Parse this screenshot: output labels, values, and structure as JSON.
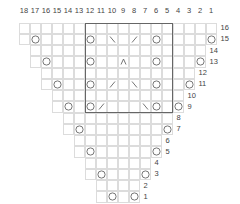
{
  "chart": {
    "title": "",
    "type": "knitting-chart",
    "columns": [
      "18",
      "17",
      "16",
      "15",
      "14",
      "13",
      "12",
      "11",
      "10",
      "9",
      "8",
      "7",
      "6",
      "5",
      "4",
      "3",
      "2",
      "1"
    ],
    "rows": [
      {
        "row": 16,
        "label": "16",
        "from_col": 18,
        "to_col": 1,
        "symbols": []
      },
      {
        "row": 15,
        "label": "15",
        "from_col": 18,
        "to_col": 1,
        "symbols": [
          {
            "col": 17,
            "type": "yo"
          },
          {
            "col": 12,
            "type": "yo"
          },
          {
            "col": 10,
            "type": "ssk"
          },
          {
            "col": 8,
            "type": "k2tog"
          },
          {
            "col": 6,
            "type": "yo"
          },
          {
            "col": 1,
            "type": "yo"
          }
        ]
      },
      {
        "row": 14,
        "label": "14",
        "from_col": 17,
        "to_col": 2,
        "symbols": []
      },
      {
        "row": 13,
        "label": "13",
        "from_col": 17,
        "to_col": 2,
        "symbols": [
          {
            "col": 16,
            "type": "yo"
          },
          {
            "col": 12,
            "type": "yo"
          },
          {
            "col": 9,
            "type": "cdd"
          },
          {
            "col": 6,
            "type": "yo"
          },
          {
            "col": 2,
            "type": "yo"
          }
        ]
      },
      {
        "row": 12,
        "label": "12",
        "from_col": 16,
        "to_col": 3,
        "symbols": []
      },
      {
        "row": 11,
        "label": "11",
        "from_col": 16,
        "to_col": 3,
        "symbols": [
          {
            "col": 15,
            "type": "yo"
          },
          {
            "col": 12,
            "type": "yo"
          },
          {
            "col": 10,
            "type": "k2tog"
          },
          {
            "col": 8,
            "type": "ssk"
          },
          {
            "col": 6,
            "type": "yo"
          },
          {
            "col": 3,
            "type": "yo"
          }
        ]
      },
      {
        "row": 10,
        "label": "10",
        "from_col": 15,
        "to_col": 4,
        "symbols": []
      },
      {
        "row": 9,
        "label": "9",
        "from_col": 15,
        "to_col": 4,
        "symbols": [
          {
            "col": 14,
            "type": "yo"
          },
          {
            "col": 12,
            "type": "yo"
          },
          {
            "col": 11,
            "type": "k2tog"
          },
          {
            "col": 7,
            "type": "ssk"
          },
          {
            "col": 6,
            "type": "yo"
          },
          {
            "col": 4,
            "type": "yo"
          }
        ]
      },
      {
        "row": 8,
        "label": "8",
        "from_col": 14,
        "to_col": 5,
        "symbols": []
      },
      {
        "row": 7,
        "label": "7",
        "from_col": 14,
        "to_col": 5,
        "symbols": [
          {
            "col": 13,
            "type": "yo"
          },
          {
            "col": 5,
            "type": "yo"
          }
        ]
      },
      {
        "row": 6,
        "label": "6",
        "from_col": 13,
        "to_col": 6,
        "symbols": []
      },
      {
        "row": 5,
        "label": "5",
        "from_col": 13,
        "to_col": 6,
        "symbols": [
          {
            "col": 12,
            "type": "yo"
          },
          {
            "col": 6,
            "type": "yo"
          }
        ]
      },
      {
        "row": 4,
        "label": "4",
        "from_col": 12,
        "to_col": 7,
        "symbols": []
      },
      {
        "row": 3,
        "label": "3",
        "from_col": 12,
        "to_col": 7,
        "symbols": [
          {
            "col": 11,
            "type": "yo"
          },
          {
            "col": 7,
            "type": "yo"
          }
        ]
      },
      {
        "row": 2,
        "label": "2",
        "from_col": 11,
        "to_col": 8,
        "symbols": []
      },
      {
        "row": 1,
        "label": "1",
        "from_col": 11,
        "to_col": 8,
        "symbols": [
          {
            "col": 10,
            "type": "yo"
          },
          {
            "col": 8,
            "type": "yo"
          }
        ]
      }
    ],
    "repeat_box": {
      "from_col": 12,
      "to_col": 5,
      "from_row": 16,
      "to_row": 9
    },
    "symbol_legend": {
      "yo": "circle-icon",
      "k2tog": "slash-right-icon",
      "ssk": "slash-left-icon",
      "cdd": "caret-up-icon"
    },
    "colors": {
      "grid": "#dcdcdc",
      "symbol": "#666666",
      "box": "#666666",
      "label": "#444444"
    }
  }
}
